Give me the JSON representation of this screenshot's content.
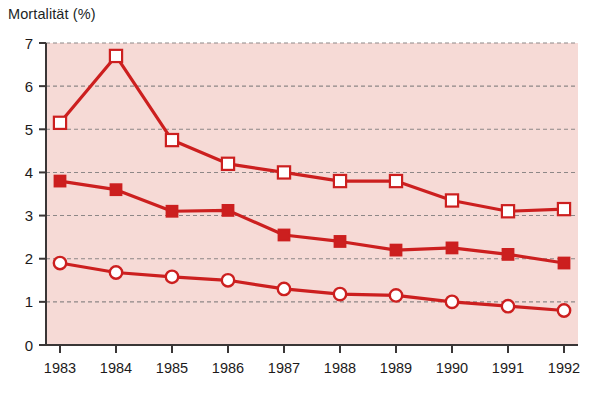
{
  "chart_data": {
    "type": "line",
    "title": "Mortalität (%)",
    "xlabel": "",
    "ylabel": "Mortalität (%)",
    "categories": [
      "1983",
      "1984",
      "1985",
      "1986",
      "1987",
      "1988",
      "1989",
      "1990",
      "1991",
      "1992"
    ],
    "x": [
      1983,
      1984,
      1985,
      1986,
      1987,
      1988,
      1989,
      1990,
      1991,
      1992
    ],
    "ylim": [
      0,
      7
    ],
    "yticks": [
      0,
      1,
      2,
      3,
      4,
      5,
      6,
      7
    ],
    "ytick_labels": [
      "0",
      "1",
      "2",
      "3",
      "4",
      "5",
      "6",
      "7"
    ],
    "grid": "horizontal-dashed",
    "legend": "none",
    "plot_background": "#f6dad6",
    "line_color": "#cc1f1f",
    "series": [
      {
        "name": "open-square-series",
        "marker": "open-square",
        "marker_face": "#ffffff",
        "marker_edge": "#cc1f1f",
        "values": [
          5.15,
          6.7,
          4.75,
          4.2,
          4.0,
          3.8,
          3.8,
          3.35,
          3.1,
          3.15
        ]
      },
      {
        "name": "filled-square-series",
        "marker": "filled-square",
        "marker_face": "#cc1f1f",
        "marker_edge": "#cc1f1f",
        "values": [
          3.8,
          3.6,
          3.1,
          3.12,
          2.55,
          2.4,
          2.2,
          2.25,
          2.1,
          1.9
        ]
      },
      {
        "name": "open-circle-series",
        "marker": "open-circle",
        "marker_face": "#ffffff",
        "marker_edge": "#cc1f1f",
        "values": [
          1.9,
          1.68,
          1.58,
          1.5,
          1.3,
          1.18,
          1.15,
          1.0,
          0.9,
          0.8
        ]
      }
    ]
  },
  "colors": {
    "accent": "#cc1f1f",
    "plot_bg": "#f6dad6",
    "axis": "#3a3636",
    "grid": "#8d8787",
    "text": "#1c1a1a",
    "page_bg": "#ffffff"
  },
  "geometry": {
    "plot_left": 46,
    "plot_right": 578,
    "plot_top": 43,
    "plot_bottom": 345
  }
}
